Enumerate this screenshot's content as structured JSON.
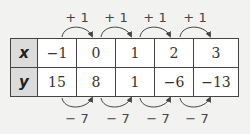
{
  "table": {
    "rows": [
      {
        "label": "x",
        "values": [
          "−1",
          "0",
          "1",
          "2",
          "3"
        ]
      },
      {
        "label": "y",
        "values": [
          "15",
          "8",
          "1",
          "−6",
          "−13"
        ]
      }
    ]
  },
  "top_differences": [
    "+ 1",
    "+ 1",
    "+ 1",
    "+ 1"
  ],
  "bottom_differences": [
    "− 7",
    "− 7",
    "− 7",
    "− 7"
  ],
  "colors": {
    "arrow": "#444444",
    "header_bg": "#dcdcdc",
    "border": "#444444"
  }
}
